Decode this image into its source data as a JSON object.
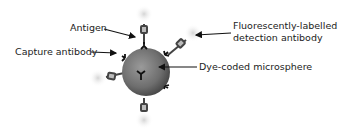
{
  "diagram": {
    "labels": {
      "antigen": "Antigen",
      "capture_antibody": "Capture antibody",
      "detection_antibody_line1": "Fluorescently-labelled",
      "detection_antibody_line2": "detection antibody",
      "microsphere": "Dye-coded microsphere"
    },
    "colors": {
      "sphere_dark": "#3a3a3a",
      "sphere_mid": "#6e6e6e",
      "sphere_light": "#9a9a9a",
      "text": "#222222",
      "arrow": "#111111",
      "glow": "#d8d8d8"
    }
  }
}
